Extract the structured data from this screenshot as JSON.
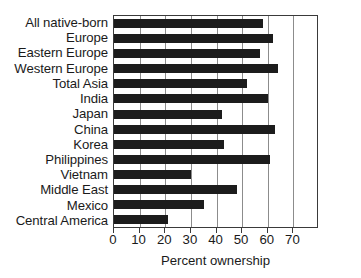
{
  "chart_data": {
    "type": "bar",
    "orientation": "horizontal",
    "title": "",
    "subtitle": "",
    "xlabel": "Percent ownership",
    "ylabel": "",
    "xlim": [
      0,
      80
    ],
    "xticks": [
      0,
      10,
      20,
      30,
      40,
      50,
      60,
      70
    ],
    "xticklabels": [
      "0",
      "10",
      "20",
      "30",
      "40",
      "50",
      "60",
      "70"
    ],
    "grid": "vertical",
    "legend": null,
    "bar_color": "#1c1c1c",
    "categories": [
      "All native-born",
      "Europe",
      "Eastern Europe",
      "Western Europe",
      "Total Asia",
      "India",
      "Japan",
      "China",
      "Korea",
      "Philippines",
      "Vietnam",
      "Middle East",
      "Mexico",
      "Central America"
    ],
    "values": [
      58,
      62,
      57,
      64,
      52,
      60,
      42,
      63,
      43,
      61,
      30,
      48,
      35,
      21
    ],
    "series": [
      {
        "name": "Percent ownership",
        "values": [
          58,
          62,
          57,
          64,
          52,
          60,
          42,
          63,
          43,
          61,
          30,
          48,
          35,
          21
        ]
      }
    ]
  },
  "axes": {
    "frame_color": "#3a3a3a",
    "gridline_color": "#8c8c8c"
  }
}
